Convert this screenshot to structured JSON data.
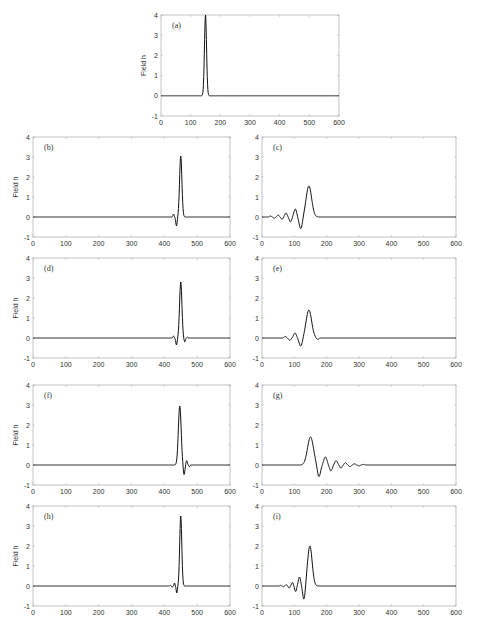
{
  "chart_data": [
    {
      "id": "a",
      "type": "line",
      "panel_label": "(a)",
      "ylabel": "Field h",
      "xlim": [
        0,
        600
      ],
      "ylim": [
        -1,
        4
      ],
      "xticks": [
        0,
        100,
        200,
        300,
        400,
        500,
        600
      ],
      "yticks": [
        -1,
        0,
        1,
        2,
        3,
        4
      ],
      "description": "Single narrow Gaussian pulse centered near x=150, peak 4",
      "features": [
        {
          "type": "gauss",
          "x0": 150,
          "amp": 4,
          "width": 5
        }
      ]
    },
    {
      "id": "b",
      "type": "line",
      "panel_label": "(b)",
      "ylabel": "Field h",
      "xlim": [
        0,
        600
      ],
      "ylim": [
        -1,
        4
      ],
      "xticks": [
        0,
        100,
        200,
        300,
        400,
        500,
        600
      ],
      "yticks": [
        -1,
        0,
        1,
        2,
        3,
        4
      ],
      "description": "Pulse near x=450 with peak ~3.0, small leading oscillation (dip ~-0.45 at x~437)",
      "features": [
        {
          "type": "gauss",
          "x0": 450,
          "amp": 3.05,
          "width": 5
        },
        {
          "type": "gauss",
          "x0": 437,
          "amp": -0.45,
          "width": 3
        },
        {
          "type": "gauss",
          "x0": 428,
          "amp": 0.15,
          "width": 2.5
        }
      ]
    },
    {
      "id": "c",
      "type": "line",
      "panel_label": "(c)",
      "ylabel": "",
      "xlim": [
        0,
        600
      ],
      "ylim": [
        -1,
        4
      ],
      "xticks": [
        0,
        100,
        200,
        300,
        400,
        500,
        600
      ],
      "yticks": [
        -1,
        0,
        1,
        2,
        3,
        4
      ],
      "description": "Dispersive wave train: peak ~1.55 at x~145, trailing oscillations to the left decaying to x~0",
      "features": [
        {
          "type": "gauss",
          "x0": 145,
          "amp": 1.55,
          "width": 12
        },
        {
          "type": "gauss",
          "x0": 120,
          "amp": -0.6,
          "width": 7
        },
        {
          "type": "gauss",
          "x0": 103,
          "amp": 0.4,
          "width": 6
        },
        {
          "type": "gauss",
          "x0": 88,
          "amp": -0.25,
          "width": 5
        },
        {
          "type": "gauss",
          "x0": 74,
          "amp": 0.2,
          "width": 5
        },
        {
          "type": "gauss",
          "x0": 62,
          "amp": -0.12,
          "width": 4
        },
        {
          "type": "gauss",
          "x0": 50,
          "amp": 0.1,
          "width": 4
        },
        {
          "type": "gauss",
          "x0": 38,
          "amp": -0.06,
          "width": 4
        },
        {
          "type": "gauss",
          "x0": 26,
          "amp": 0.05,
          "width": 4
        }
      ]
    },
    {
      "id": "d",
      "type": "line",
      "panel_label": "(d)",
      "ylabel": "Field h",
      "xlim": [
        0,
        600
      ],
      "ylim": [
        -1,
        4
      ],
      "xticks": [
        0,
        100,
        200,
        300,
        400,
        500,
        600
      ],
      "yticks": [
        -1,
        0,
        1,
        2,
        3,
        4
      ],
      "description": "Pulse near x=450 peak ~2.8, small dips on both sides",
      "features": [
        {
          "type": "gauss",
          "x0": 450,
          "amp": 2.8,
          "width": 5
        },
        {
          "type": "gauss",
          "x0": 437,
          "amp": -0.35,
          "width": 3
        },
        {
          "type": "gauss",
          "x0": 428,
          "amp": 0.1,
          "width": 2.5
        },
        {
          "type": "gauss",
          "x0": 462,
          "amp": -0.2,
          "width": 3
        },
        {
          "type": "gauss",
          "x0": 470,
          "amp": 0.05,
          "width": 2.5
        }
      ]
    },
    {
      "id": "e",
      "type": "line",
      "panel_label": "(e)",
      "ylabel": "",
      "xlim": [
        0,
        600
      ],
      "ylim": [
        -1,
        4
      ],
      "xticks": [
        0,
        100,
        200,
        300,
        400,
        500,
        600
      ],
      "yticks": [
        -1,
        0,
        1,
        2,
        3,
        4
      ],
      "description": "Wave: peak ~1.4 at x~145, dip ~-0.4 at x~120, small oscillations",
      "features": [
        {
          "type": "gauss",
          "x0": 145,
          "amp": 1.4,
          "width": 12
        },
        {
          "type": "gauss",
          "x0": 120,
          "amp": -0.42,
          "width": 7
        },
        {
          "type": "gauss",
          "x0": 102,
          "amp": 0.25,
          "width": 6
        },
        {
          "type": "gauss",
          "x0": 86,
          "amp": -0.12,
          "width": 5
        },
        {
          "type": "gauss",
          "x0": 72,
          "amp": 0.08,
          "width": 5
        },
        {
          "type": "gauss",
          "x0": 172,
          "amp": -0.08,
          "width": 5
        }
      ]
    },
    {
      "id": "f",
      "type": "line",
      "panel_label": "(f)",
      "ylabel": "Field h",
      "xlim": [
        0,
        600
      ],
      "ylim": [
        -1,
        4
      ],
      "xticks": [
        0,
        100,
        200,
        300,
        400,
        500,
        600
      ],
      "yticks": [
        -1,
        0,
        1,
        2,
        3,
        4
      ],
      "description": "Pulse near x=448 peak ~2.95, trailing oscillation dip ~-0.5 at x~460",
      "features": [
        {
          "type": "gauss",
          "x0": 447,
          "amp": 2.95,
          "width": 6
        },
        {
          "type": "gauss",
          "x0": 460,
          "amp": -0.5,
          "width": 3.5
        },
        {
          "type": "gauss",
          "x0": 468,
          "amp": 0.22,
          "width": 3
        },
        {
          "type": "gauss",
          "x0": 476,
          "amp": -0.08,
          "width": 2.5
        }
      ]
    },
    {
      "id": "g",
      "type": "line",
      "panel_label": "(g)",
      "ylabel": "",
      "xlim": [
        0,
        600
      ],
      "ylim": [
        -1,
        4
      ],
      "xticks": [
        0,
        100,
        200,
        300,
        400,
        500,
        600
      ],
      "yticks": [
        -1,
        0,
        1,
        2,
        3,
        4
      ],
      "description": "Wave: peak ~1.4 at x~150, trailing decaying oscillations to the right until x~350",
      "features": [
        {
          "type": "gauss",
          "x0": 150,
          "amp": 1.4,
          "width": 13
        },
        {
          "type": "gauss",
          "x0": 176,
          "amp": -0.6,
          "width": 7
        },
        {
          "type": "gauss",
          "x0": 196,
          "amp": 0.4,
          "width": 7
        },
        {
          "type": "gauss",
          "x0": 213,
          "amp": -0.3,
          "width": 6
        },
        {
          "type": "gauss",
          "x0": 229,
          "amp": 0.22,
          "width": 6
        },
        {
          "type": "gauss",
          "x0": 244,
          "amp": -0.16,
          "width": 5
        },
        {
          "type": "gauss",
          "x0": 258,
          "amp": 0.12,
          "width": 5
        },
        {
          "type": "gauss",
          "x0": 272,
          "amp": -0.08,
          "width": 5
        },
        {
          "type": "gauss",
          "x0": 286,
          "amp": 0.06,
          "width": 5
        },
        {
          "type": "gauss",
          "x0": 300,
          "amp": -0.04,
          "width": 5
        },
        {
          "type": "gauss",
          "x0": 314,
          "amp": 0.03,
          "width": 5
        }
      ]
    },
    {
      "id": "h",
      "type": "line",
      "panel_label": "(h)",
      "ylabel": "Field h",
      "xlim": [
        0,
        600
      ],
      "ylim": [
        -1,
        4
      ],
      "xticks": [
        0,
        100,
        200,
        300,
        400,
        500,
        600
      ],
      "yticks": [
        -1,
        0,
        1,
        2,
        3,
        4
      ],
      "description": "Pulse near x=450 peak ~3.5, small leading ripples",
      "features": [
        {
          "type": "gauss",
          "x0": 450,
          "amp": 3.5,
          "width": 4.5
        },
        {
          "type": "gauss",
          "x0": 438,
          "amp": -0.35,
          "width": 2.5
        },
        {
          "type": "gauss",
          "x0": 431,
          "amp": 0.15,
          "width": 2
        },
        {
          "type": "gauss",
          "x0": 424,
          "amp": -0.07,
          "width": 2
        },
        {
          "type": "gauss",
          "x0": 418,
          "amp": 0.04,
          "width": 2
        }
      ]
    },
    {
      "id": "i",
      "type": "line",
      "panel_label": "(i)",
      "ylabel": "",
      "xlim": [
        0,
        600
      ],
      "ylim": [
        -1,
        4
      ],
      "xticks": [
        0,
        100,
        200,
        300,
        400,
        500,
        600
      ],
      "yticks": [
        -1,
        0,
        1,
        2,
        3,
        4
      ],
      "description": "Wave: peak ~2.0 at x~148, dip ~-0.7 at x~130, leading oscillations decaying to the left",
      "features": [
        {
          "type": "gauss",
          "x0": 148,
          "amp": 2.0,
          "width": 10
        },
        {
          "type": "gauss",
          "x0": 130,
          "amp": -0.72,
          "width": 5.5
        },
        {
          "type": "gauss",
          "x0": 116,
          "amp": 0.45,
          "width": 5
        },
        {
          "type": "gauss",
          "x0": 104,
          "amp": -0.28,
          "width": 4
        },
        {
          "type": "gauss",
          "x0": 94,
          "amp": 0.18,
          "width": 4
        },
        {
          "type": "gauss",
          "x0": 84,
          "amp": -0.1,
          "width": 3.5
        },
        {
          "type": "gauss",
          "x0": 75,
          "amp": 0.07,
          "width": 3.5
        },
        {
          "type": "gauss",
          "x0": 66,
          "amp": -0.04,
          "width": 3
        },
        {
          "type": "gauss",
          "x0": 57,
          "amp": 0.03,
          "width": 3
        }
      ]
    }
  ],
  "layout": {
    "panels": {
      "a": {
        "x0": 161,
        "x1": 339,
        "y4": 15,
        "ym1": 116
      },
      "b": {
        "x0": 33,
        "x1": 230,
        "y4": 137,
        "ym1": 237
      },
      "c": {
        "x0": 262,
        "x1": 456,
        "y4": 137,
        "ym1": 237
      },
      "d": {
        "x0": 33,
        "x1": 230,
        "y4": 258,
        "ym1": 358
      },
      "e": {
        "x0": 262,
        "x1": 456,
        "y4": 258,
        "ym1": 358
      },
      "f": {
        "x0": 33,
        "x1": 230,
        "y4": 385,
        "ym1": 485
      },
      "g": {
        "x0": 262,
        "x1": 456,
        "y4": 385,
        "ym1": 485
      },
      "h": {
        "x0": 33,
        "x1": 230,
        "y4": 506,
        "ym1": 606
      },
      "i": {
        "x0": 262,
        "x1": 456,
        "y4": 506,
        "ym1": 606
      }
    }
  }
}
